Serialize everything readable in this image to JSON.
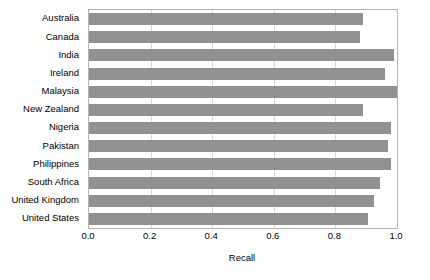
{
  "chart_data": {
    "type": "bar",
    "orientation": "horizontal",
    "title": "",
    "xlabel": "Recall",
    "ylabel": "",
    "xlim": [
      0.0,
      1.0
    ],
    "xticks": [
      "0.0",
      "0.2",
      "0.4",
      "0.6",
      "0.8",
      "1.0"
    ],
    "xtick_values": [
      0.0,
      0.2,
      0.4,
      0.6,
      0.8,
      1.0
    ],
    "grid": true,
    "legend": "none",
    "bar_color": "#919191",
    "categories": [
      "Australia",
      "Canada",
      "India",
      "Ireland",
      "Malaysia",
      "New Zealand",
      "Nigeria",
      "Pakistan",
      "Philippines",
      "South Africa",
      "United Kingdom",
      "United States"
    ],
    "values": [
      0.89,
      0.88,
      0.99,
      0.96,
      1.0,
      0.89,
      0.98,
      0.97,
      0.98,
      0.945,
      0.925,
      0.905
    ]
  }
}
